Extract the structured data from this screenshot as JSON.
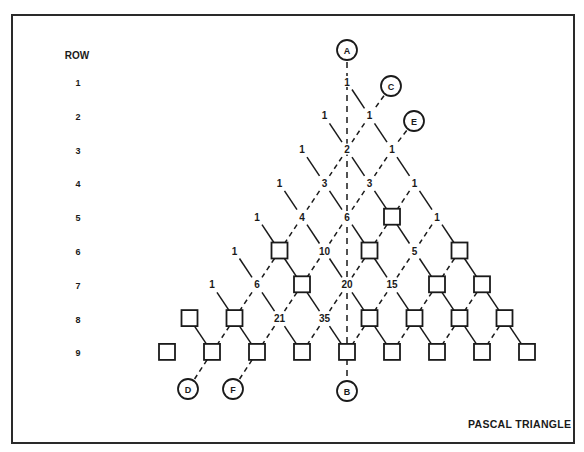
{
  "diagram": {
    "title": "PASCAL TRIANGLE",
    "row_header": "ROW",
    "row_numbers": [
      "1",
      "2",
      "3",
      "4",
      "5",
      "6",
      "7",
      "8",
      "9"
    ],
    "rows": [
      [
        1
      ],
      [
        1,
        1
      ],
      [
        1,
        2,
        1
      ],
      [
        1,
        3,
        3,
        1
      ],
      [
        1,
        4,
        6,
        null,
        1
      ],
      [
        1,
        null,
        10,
        null,
        5,
        null
      ],
      [
        1,
        6,
        null,
        20,
        15,
        null,
        null
      ],
      [
        null,
        null,
        21,
        35,
        null,
        null,
        null,
        null
      ],
      [
        null,
        null,
        null,
        null,
        null,
        null,
        null,
        null,
        null
      ]
    ],
    "blank_cell_symbol": "square",
    "edge_styles": {
      "down_right": "solid",
      "down_left": "dashed"
    },
    "markers": [
      {
        "label": "A",
        "x": 347,
        "y": 50
      },
      {
        "label": "B",
        "x": 347,
        "y": 391
      },
      {
        "label": "C",
        "x": 391,
        "y": 86
      },
      {
        "label": "D",
        "x": 188,
        "y": 389
      },
      {
        "label": "E",
        "x": 414,
        "y": 121
      },
      {
        "label": "F",
        "x": 233,
        "y": 389
      }
    ],
    "guide_lines": [
      {
        "from": "A",
        "to": "B",
        "style": "dashed",
        "description": "vertical axis of symmetry"
      },
      {
        "from": "C",
        "to": "D",
        "style": "dashed",
        "description": "diagonal k=1"
      },
      {
        "from": "E",
        "to": "F",
        "style": "dashed",
        "description": "diagonal k=2"
      }
    ],
    "colors": {
      "ink": "#1a1a1a",
      "background": "#ffffff",
      "frame": "#2a2a2a"
    }
  }
}
